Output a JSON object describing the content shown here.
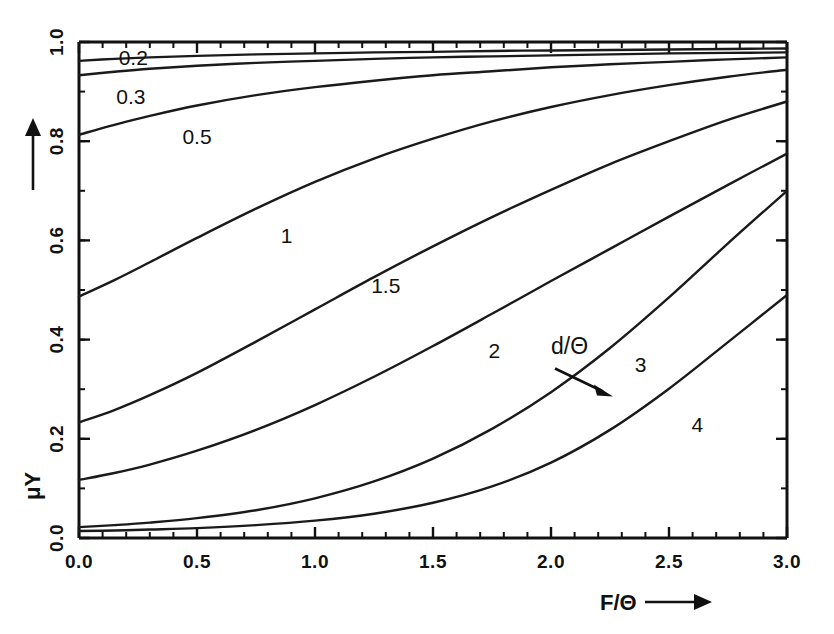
{
  "chart_data": {
    "type": "line",
    "title": "",
    "xlabel": "F/Θ",
    "ylabel": "μY",
    "xlim": [
      0.0,
      3.0
    ],
    "ylim": [
      0.0,
      1.0
    ],
    "grid": false,
    "legend": "inline-curve-labels",
    "annotation": {
      "text": "d/Θ",
      "points_to": "3",
      "x": 2.0,
      "y": 0.37
    },
    "x_ticks_major": [
      "0.0",
      "0.5",
      "1.0",
      "1.5",
      "2.0",
      "2.5",
      "3.0"
    ],
    "x_tick_values": [
      0.0,
      0.5,
      1.0,
      1.5,
      2.0,
      2.5,
      3.0
    ],
    "x_minor_step": 0.1,
    "y_ticks_major": [
      "0.0",
      "0.2",
      "0.4",
      "0.6",
      "0.8",
      "1.0"
    ],
    "y_tick_values": [
      0.0,
      0.2,
      0.4,
      0.6,
      0.8,
      1.0
    ],
    "y_minor_step": 0.1,
    "series_param_name": "d/Θ",
    "series": [
      {
        "name": "0.2",
        "label": "0.2",
        "label_x": 0.23,
        "label_y": 0.965,
        "x": [
          0.0,
          0.15,
          0.3,
          0.5,
          0.75,
          1.0,
          1.25,
          1.5,
          1.75,
          2.0,
          2.25,
          2.5,
          2.75,
          3.0
        ],
        "y": [
          0.962,
          0.966,
          0.969,
          0.972,
          0.975,
          0.977,
          0.979,
          0.98,
          0.982,
          0.983,
          0.984,
          0.985,
          0.986,
          0.987
        ]
      },
      {
        "name": "0.3",
        "label": "0.3",
        "label_x": 0.22,
        "label_y": 0.886,
        "x": [
          0.0,
          0.15,
          0.3,
          0.5,
          0.75,
          1.0,
          1.25,
          1.5,
          1.75,
          2.0,
          2.25,
          2.5,
          2.75,
          3.0
        ],
        "y": [
          0.933,
          0.94,
          0.946,
          0.952,
          0.958,
          0.962,
          0.966,
          0.969,
          0.971,
          0.973,
          0.975,
          0.977,
          0.978,
          0.979
        ]
      },
      {
        "name": "0.5",
        "label": "0.5",
        "label_x": 0.5,
        "label_y": 0.805,
        "x": [
          0.0,
          0.15,
          0.3,
          0.5,
          0.75,
          1.0,
          1.25,
          1.5,
          1.75,
          2.0,
          2.25,
          2.5,
          2.75,
          3.0
        ],
        "y": [
          0.813,
          0.833,
          0.851,
          0.872,
          0.893,
          0.909,
          0.922,
          0.933,
          0.941,
          0.949,
          0.955,
          0.96,
          0.965,
          0.969
        ]
      },
      {
        "name": "1",
        "label": "1",
        "label_x": 0.88,
        "label_y": 0.605,
        "x": [
          0.0,
          0.15,
          0.3,
          0.5,
          0.75,
          1.0,
          1.25,
          1.5,
          1.75,
          2.0,
          2.25,
          2.5,
          2.75,
          3.0
        ],
        "y": [
          0.487,
          0.52,
          0.556,
          0.605,
          0.664,
          0.718,
          0.765,
          0.805,
          0.84,
          0.869,
          0.893,
          0.913,
          0.93,
          0.944
        ]
      },
      {
        "name": "1.5",
        "label": "1.5",
        "label_x": 1.3,
        "label_y": 0.505,
        "x": [
          0.0,
          0.15,
          0.3,
          0.5,
          0.75,
          1.0,
          1.25,
          1.5,
          1.75,
          2.0,
          2.25,
          2.5,
          2.75,
          3.0
        ],
        "y": [
          0.233,
          0.258,
          0.288,
          0.333,
          0.396,
          0.461,
          0.526,
          0.588,
          0.647,
          0.702,
          0.754,
          0.8,
          0.843,
          0.88
        ]
      },
      {
        "name": "2",
        "label": "2",
        "label_x": 1.76,
        "label_y": 0.375,
        "x": [
          0.0,
          0.15,
          0.3,
          0.5,
          0.75,
          1.0,
          1.25,
          1.5,
          1.75,
          2.0,
          2.25,
          2.5,
          2.75,
          3.0
        ],
        "y": [
          0.117,
          0.131,
          0.148,
          0.176,
          0.218,
          0.268,
          0.325,
          0.387,
          0.452,
          0.518,
          0.583,
          0.648,
          0.712,
          0.775
        ]
      },
      {
        "name": "3",
        "label": "3",
        "label_x": 2.38,
        "label_y": 0.345,
        "x": [
          0.0,
          0.15,
          0.3,
          0.5,
          0.75,
          1.0,
          1.25,
          1.5,
          1.75,
          2.0,
          2.25,
          2.5,
          2.75,
          3.0
        ],
        "y": [
          0.022,
          0.026,
          0.031,
          0.04,
          0.056,
          0.08,
          0.114,
          0.16,
          0.22,
          0.294,
          0.383,
          0.485,
          0.594,
          0.7
        ]
      },
      {
        "name": "4",
        "label": "4",
        "label_x": 2.62,
        "label_y": 0.225,
        "x": [
          0.0,
          0.15,
          0.3,
          0.5,
          0.75,
          1.0,
          1.25,
          1.5,
          1.75,
          2.0,
          2.25,
          2.5,
          2.75,
          3.0
        ],
        "y": [
          0.014,
          0.015,
          0.017,
          0.02,
          0.026,
          0.035,
          0.049,
          0.071,
          0.104,
          0.152,
          0.218,
          0.301,
          0.395,
          0.49
        ]
      }
    ]
  },
  "style": {
    "background": "#ffffff",
    "ink": "#111111",
    "curve_color": "#1a1a1a"
  }
}
